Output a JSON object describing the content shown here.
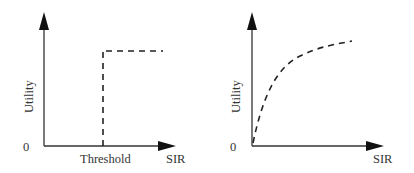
{
  "panels": [
    {
      "id": "step",
      "ylabel": "Utility",
      "xlabel": "SIR",
      "origin_label": "0",
      "threshold_label": "Threshold"
    },
    {
      "id": "concave",
      "ylabel": "Utility",
      "xlabel": "SIR",
      "origin_label": "0"
    }
  ],
  "colors": {
    "axis": "#333333",
    "curve": "#333333",
    "text": "#333333"
  }
}
